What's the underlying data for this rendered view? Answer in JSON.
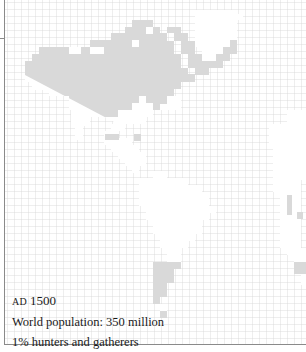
{
  "map": {
    "region": "Americas",
    "grid_cell_px": 7,
    "colors": {
      "grid_line": "#d4d4d4",
      "land": "#ffffff",
      "hunter_gatherer_shade": "#d9d9d9",
      "border": "#8a8a8a",
      "text": "#1a1a1a"
    }
  },
  "legend": {
    "era": "AD",
    "year": "1500",
    "population": "World population: 350 million",
    "share": "1% hunters and gatherers"
  }
}
